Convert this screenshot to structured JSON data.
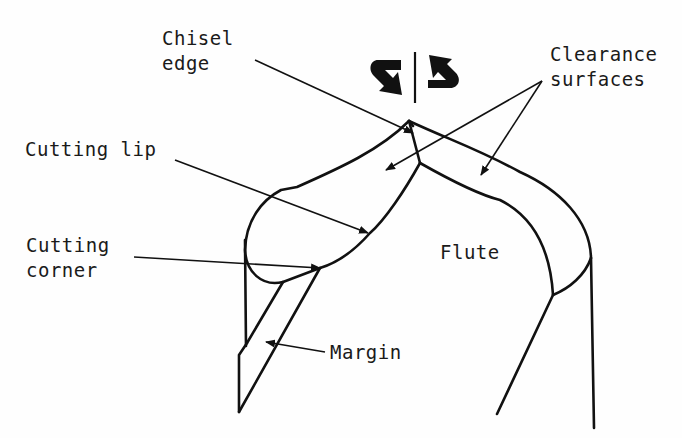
{
  "diagram": {
    "labels": {
      "chisel_edge": [
        "Chisel",
        "edge"
      ],
      "clearance_surfaces": [
        "Clearance",
        "surfaces"
      ],
      "cutting_lip": "Cutting lip",
      "cutting_corner": [
        "Cutting",
        "corner"
      ],
      "flute": "Flute",
      "margin": "Margin"
    },
    "icons": {
      "rotation_symbol": "rotation-direction-arrows"
    },
    "colors": {
      "line": "#111111",
      "background": "#fefefe"
    }
  }
}
